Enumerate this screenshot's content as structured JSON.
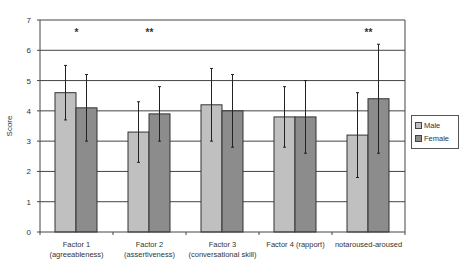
{
  "chart_data": {
    "type": "bar",
    "title": "",
    "xlabel": "",
    "ylabel": "Score",
    "ylim": [
      0,
      7
    ],
    "yticks": [
      0,
      1,
      2,
      3,
      4,
      5,
      6,
      7
    ],
    "grid": true,
    "legend_position": "right",
    "categories": [
      [
        "Factor 1",
        "(agreeableness)"
      ],
      [
        "Factor 2",
        "(assertiveness)"
      ],
      [
        "Factor 3",
        "(conversational skill)"
      ],
      [
        "Factor 4 (rapport)"
      ],
      [
        "notaroused-aroused"
      ]
    ],
    "significance": [
      "*",
      "**",
      "",
      "",
      "**"
    ],
    "series": [
      {
        "name": "Male",
        "color": "#c0c0c0",
        "values": [
          4.6,
          3.3,
          4.2,
          3.8,
          3.2
        ],
        "error_low": [
          3.7,
          2.3,
          3.0,
          2.8,
          1.8
        ],
        "error_high": [
          5.5,
          4.3,
          5.4,
          4.8,
          4.6
        ]
      },
      {
        "name": "Female",
        "color": "#8c8c8c",
        "values": [
          4.1,
          3.9,
          4.0,
          3.8,
          4.4
        ],
        "error_low": [
          3.0,
          3.0,
          2.8,
          2.6,
          2.6
        ],
        "error_high": [
          5.2,
          4.8,
          5.2,
          5.0,
          6.2
        ]
      }
    ]
  },
  "legend": {
    "items": [
      {
        "label": "Male",
        "color": "#c0c0c0"
      },
      {
        "label": "Female",
        "color": "#8c8c8c"
      }
    ]
  }
}
